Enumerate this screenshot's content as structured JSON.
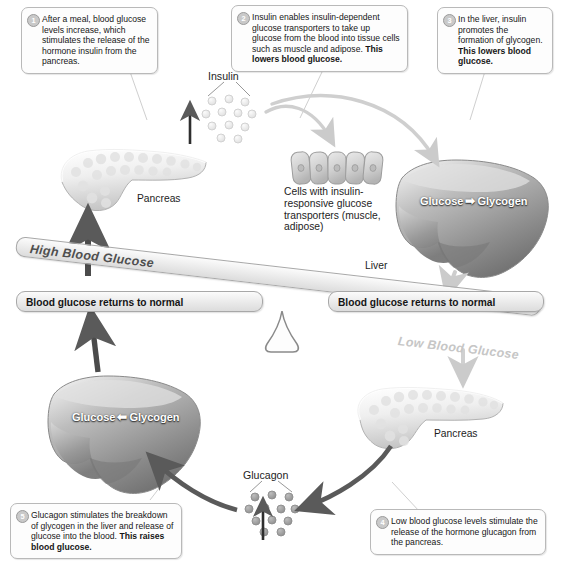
{
  "figure": {
    "type": "biology-process-diagram"
  },
  "callouts": [
    {
      "number": "1",
      "text_plain": "After a meal, blood glucose levels increase, which stimulates the release of the hormone insulin from the pancreas.",
      "text_regular": "After a meal, blood glucose levels increase, which stimulates the release of the hormone insulin from the pancreas.",
      "text_bold": ""
    },
    {
      "number": "2",
      "text_plain": "Insulin enables insulin-dependent glucose transporters to take up glucose from the blood into tissue cells such as muscle and adipose. This lowers blood glucose.",
      "text_regular": "Insulin enables insulin-dependent glucose transporters to take up glucose from the blood into tissue cells such as muscle and adipose. ",
      "text_bold": "This lowers blood glucose."
    },
    {
      "number": "3",
      "text_plain": "In the liver, insulin promotes the formation of glycogen. This lowers blood glucose.",
      "text_regular": "In the liver, insulin promotes the formation of glycogen. ",
      "text_bold": "This lowers blood glucose."
    },
    {
      "number": "4",
      "text_plain": "Low blood glucose levels stimulate the release of the hormone glucagon from the pancreas.",
      "text_regular": "Low blood glucose levels stimulate the release of the hormone glucagon from the pancreas.",
      "text_bold": ""
    },
    {
      "number": "5",
      "text_plain": "Glucagon stimulates the breakdown of glycogen in the liver and release of glucose into the blood. This raises blood glucose.",
      "text_regular": "Glucagon stimulates the breakdown of glycogen in the liver and release of glucose into the blood. ",
      "text_bold": "This raises blood glucose."
    }
  ],
  "balance": {
    "high_label": "High Blood Glucose",
    "low_label": "Low Blood Glucose",
    "normal_left_label": "Blood glucose returns to normal",
    "normal_right_label": "Blood glucose returns to normal"
  },
  "labels": {
    "insulin": "Insulin",
    "glucagon": "Glucagon",
    "pancreas_top": "Pancreas",
    "pancreas_bottom": "Pancreas",
    "liver": "Liver",
    "cells": "Cells with insulin-responsive glucose transporters (muscle, adipose)"
  },
  "liver_reactions": {
    "top_left": "Glucose",
    "top_arrow": "➡",
    "top_right": "Glycogen",
    "bottom_left": "Glucose",
    "bottom_arrow": "⬅",
    "bottom_right": "Glycogen"
  },
  "colors": {
    "background": "#ffffff",
    "text": "#1b1b1b",
    "callout_border": "#b9b9b9",
    "callout_fill": "#fdfdfd",
    "bar_fill": "#ededed",
    "bar_border": "#a8a8a8",
    "arrow_dark": "#5a5a5a",
    "arrow_light": "#cfcfcf",
    "organ_label": "#ffffff",
    "low_label_gray": "#c6c6c6",
    "high_label_gray": "#4f4f4f"
  }
}
